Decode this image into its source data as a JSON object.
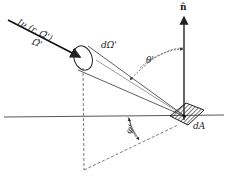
{
  "diagram": {
    "labels": {
      "intensity": "Iν (r, Ω̂')",
      "direction": "Ω̂'",
      "solid_angle": "dΩ'",
      "polar_angle": "θ'",
      "normal": "n̂",
      "azimuth": "φ'",
      "area": "dA"
    },
    "colors": {
      "line": "#222222",
      "dashed": "#555555",
      "background": "#ffffff"
    }
  }
}
